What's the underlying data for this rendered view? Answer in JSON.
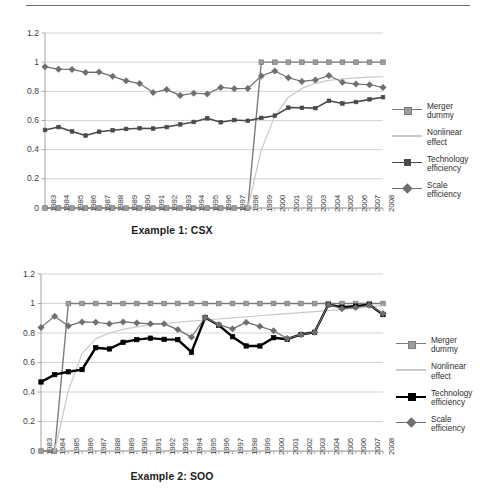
{
  "page": {
    "rule": "horizontal-rule"
  },
  "figures": [
    {
      "id": "figure-1",
      "title": "Example 1: CSX",
      "legend": [
        {
          "label": "Merger\ndummy",
          "color": "#7b7b7b",
          "marker": "square",
          "width": 1.4,
          "marker_size": 4.6
        },
        {
          "label": "Nonlinear\neffect",
          "color": "#c9c9c9",
          "marker": "none",
          "width": 1.2,
          "marker_size": 0
        },
        {
          "label": "Technology\nefficiency",
          "color": "#4a4a4a",
          "marker": "square",
          "width": 1.6,
          "marker_size": 3.6
        },
        {
          "label": "Scale\nefficiency",
          "color": "#6e6e6e",
          "marker": "diamond",
          "width": 1.2,
          "marker_size": 3.4
        }
      ]
    },
    {
      "id": "figure-2",
      "title": "Example 2: SOO",
      "legend": [
        {
          "label": "Merger\ndummy",
          "color": "#7b7b7b",
          "marker": "square",
          "width": 1.4,
          "marker_size": 4.6
        },
        {
          "label": "Nonlinear\neffect",
          "color": "#c9c9c9",
          "marker": "none",
          "width": 1.2,
          "marker_size": 0
        },
        {
          "label": "Technology\nefficiency",
          "color": "#000000",
          "marker": "square",
          "width": 2.4,
          "marker_size": 4.4
        },
        {
          "label": "Scale\nefficiency",
          "color": "#6e6e6e",
          "marker": "diamond",
          "width": 1.2,
          "marker_size": 3.4
        }
      ]
    }
  ],
  "chart_data": [
    {
      "type": "line",
      "title": "Example 1: CSX",
      "xlabel": "",
      "ylabel": "",
      "ylim": [
        0,
        1.2
      ],
      "yticks": [
        "0",
        "0.2",
        "0.4",
        "0.6",
        "0.8",
        "1",
        "1.2"
      ],
      "ytick_values": [
        0,
        0.2,
        0.4,
        0.6,
        0.8,
        1.0,
        1.2
      ],
      "grid": true,
      "legend_position": "right",
      "categories": [
        "1983",
        "1984",
        "1985",
        "1986",
        "1987",
        "1988",
        "1989",
        "1990",
        "1991",
        "1992",
        "1993",
        "1994",
        "1995",
        "1996",
        "1997",
        "1998",
        "1999",
        "2000",
        "2001",
        "2002",
        "2003",
        "2004",
        "2005",
        "2006",
        "2007",
        "2008"
      ],
      "series": [
        {
          "name": "Merger dummy",
          "color": "#7b7b7b",
          "marker": "square",
          "values": [
            0,
            0,
            0,
            0,
            0,
            0,
            0,
            0,
            0,
            0,
            0,
            0,
            0,
            0,
            0,
            0,
            1,
            1,
            1,
            1,
            1,
            1,
            1,
            1,
            1,
            1
          ]
        },
        {
          "name": "Nonlinear effect",
          "color": "#c9c9c9",
          "marker": "none",
          "values": [
            null,
            null,
            null,
            null,
            null,
            null,
            null,
            null,
            null,
            null,
            null,
            null,
            null,
            null,
            null,
            0.0,
            0.4,
            0.63,
            0.76,
            0.82,
            0.855,
            0.875,
            0.885,
            0.892,
            0.897,
            0.9
          ]
        },
        {
          "name": "Technology efficiency",
          "color": "#4a4a4a",
          "marker": "square",
          "values": [
            0.535,
            0.555,
            0.525,
            0.497,
            0.523,
            0.533,
            0.542,
            0.547,
            0.545,
            0.555,
            0.573,
            0.59,
            0.615,
            0.588,
            0.603,
            0.598,
            0.618,
            0.633,
            0.688,
            0.687,
            0.685,
            0.735,
            0.717,
            0.727,
            0.745,
            0.76
          ]
        },
        {
          "name": "Scale efficiency",
          "color": "#6e6e6e",
          "marker": "diamond",
          "values": [
            0.968,
            0.952,
            0.95,
            0.93,
            0.932,
            0.903,
            0.872,
            0.853,
            0.792,
            0.812,
            0.772,
            0.787,
            0.782,
            0.827,
            0.818,
            0.82,
            0.905,
            0.94,
            0.893,
            0.868,
            0.878,
            0.908,
            0.862,
            0.85,
            0.845,
            0.827
          ]
        }
      ]
    },
    {
      "type": "line",
      "title": "Example 2: SOO",
      "xlabel": "",
      "ylabel": "",
      "ylim": [
        0,
        1.2
      ],
      "yticks": [
        "0",
        "0.2",
        "0.4",
        "0.6",
        "0.8",
        "1",
        "1.2"
      ],
      "ytick_values": [
        0,
        0.2,
        0.4,
        0.6,
        0.8,
        1.0,
        1.2
      ],
      "grid": true,
      "legend_position": "right",
      "categories": [
        "1983",
        "1984",
        "1985",
        "1986",
        "1987",
        "1988",
        "1989",
        "1990",
        "1991",
        "1992",
        "1993",
        "1994",
        "1995",
        "1996",
        "1997",
        "1998",
        "1999",
        "2000",
        "2001",
        "2002",
        "2003",
        "2004",
        "2005",
        "2006",
        "2007",
        "2008"
      ],
      "series": [
        {
          "name": "Merger dummy",
          "color": "#7b7b7b",
          "marker": "square",
          "values": [
            0,
            0,
            1,
            1,
            1,
            1,
            1,
            1,
            1,
            1,
            1,
            1,
            1,
            1,
            1,
            1,
            1,
            1,
            1,
            1,
            1,
            1,
            1,
            1,
            1,
            1
          ]
        },
        {
          "name": "Nonlinear effect",
          "color": "#c9c9c9",
          "marker": "none",
          "values": [
            null,
            0.0,
            0.41,
            0.66,
            0.76,
            0.8,
            0.825,
            0.842,
            0.855,
            0.865,
            0.873,
            0.88,
            0.888,
            0.895,
            0.902,
            0.91,
            0.917,
            0.924,
            0.931,
            0.938,
            0.945,
            0.952,
            0.96,
            0.968,
            0.977,
            0.985
          ]
        },
        {
          "name": "Technology efficiency",
          "color": "#000000",
          "marker": "square",
          "values": [
            0.468,
            0.518,
            0.537,
            0.552,
            0.7,
            0.692,
            0.737,
            0.755,
            0.765,
            0.757,
            0.755,
            0.67,
            0.905,
            0.852,
            0.775,
            0.712,
            0.712,
            0.768,
            0.758,
            0.79,
            0.805,
            0.992,
            0.975,
            0.982,
            0.992,
            0.925
          ]
        },
        {
          "name": "Scale efficiency",
          "color": "#6e6e6e",
          "marker": "diamond",
          "values": [
            0.838,
            0.913,
            0.848,
            0.875,
            0.873,
            0.862,
            0.875,
            0.868,
            0.862,
            0.862,
            0.823,
            0.772,
            0.905,
            0.857,
            0.828,
            0.872,
            0.845,
            0.815,
            0.763,
            0.788,
            0.805,
            0.992,
            0.965,
            0.972,
            0.988,
            0.932
          ]
        }
      ]
    }
  ]
}
